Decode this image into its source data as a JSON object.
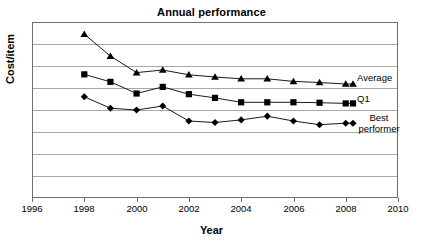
{
  "chart_data": {
    "type": "line",
    "title": "Annual performance",
    "xlabel": "Year",
    "ylabel": "Cost/item",
    "xlim": [
      1996,
      2010
    ],
    "ylim": [
      0,
      8
    ],
    "xticks": [
      "1996",
      "1998",
      "2000",
      "2002",
      "2004",
      "2006",
      "2008",
      "2010"
    ],
    "yticks": [],
    "grid": "horizontal",
    "legend_position": "right-inline",
    "x": [
      1998,
      1999,
      2000,
      2001,
      2002,
      2003,
      2004,
      2005,
      2006,
      2007,
      2008
    ],
    "series": [
      {
        "name": "Average",
        "marker": "triangle",
        "values": [
          7.45,
          6.45,
          5.7,
          5.82,
          5.6,
          5.5,
          5.42,
          5.42,
          5.3,
          5.25,
          5.18
        ]
      },
      {
        "name": "Q1",
        "marker": "square",
        "values": [
          5.62,
          5.28,
          4.75,
          5.05,
          4.72,
          4.55,
          4.35,
          4.35,
          4.35,
          4.33,
          4.3
        ]
      },
      {
        "name": "Best performer",
        "marker": "diamond",
        "values": [
          4.6,
          4.08,
          4.0,
          4.18,
          3.5,
          3.43,
          3.55,
          3.72,
          3.5,
          3.33,
          3.4
        ]
      }
    ]
  },
  "labels": {
    "average": "Average",
    "q1": "Q1",
    "best_performer": "Best\nperformer"
  }
}
